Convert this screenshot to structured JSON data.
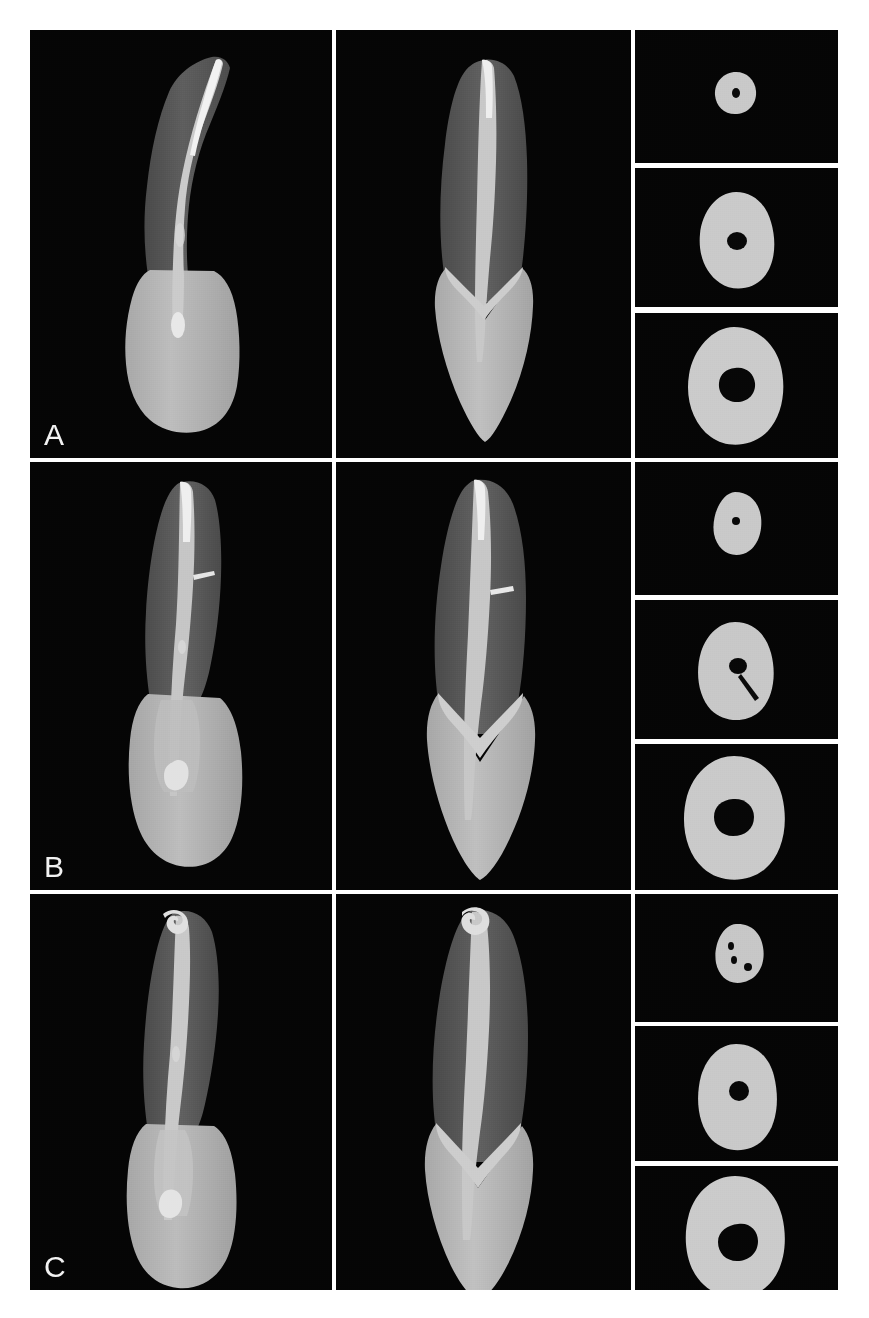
{
  "figure": {
    "background_color": "#ffffff",
    "panel_background_color": "#050505",
    "label_color": "#f2f2f2",
    "tissue_colors": {
      "enamel": "#b9b9b9",
      "dentin": "#5a5a5a",
      "canal_filling": "#cfcfcf",
      "canal_highlight": "#f0f0f0",
      "cross_section_dentin": "#c8c8c8",
      "canal_lumen": "#070707"
    },
    "rows": [
      {
        "label": "A",
        "specimen": "tooth-a",
        "views": [
          {
            "name": "buccolingual-view",
            "caption": ""
          },
          {
            "name": "proximal-view",
            "caption": ""
          },
          {
            "name": "axial-sections",
            "caption": ""
          }
        ],
        "cross_sections": [
          {
            "level": "apical",
            "canal_shape": "round",
            "canal_count": 1
          },
          {
            "level": "middle",
            "canal_shape": "oval",
            "canal_count": 1
          },
          {
            "level": "coronal",
            "canal_shape": "irregular-oval",
            "canal_count": 1
          }
        ]
      },
      {
        "label": "B",
        "specimen": "tooth-b",
        "views": [
          {
            "name": "buccolingual-view",
            "caption": ""
          },
          {
            "name": "proximal-view",
            "caption": ""
          },
          {
            "name": "axial-sections",
            "caption": ""
          }
        ],
        "cross_sections": [
          {
            "level": "apical",
            "canal_shape": "round",
            "canal_count": 1
          },
          {
            "level": "middle",
            "canal_shape": "oval-with-fin",
            "canal_count": 1
          },
          {
            "level": "coronal",
            "canal_shape": "rounded-square",
            "canal_count": 1
          }
        ]
      },
      {
        "label": "C",
        "specimen": "tooth-c",
        "views": [
          {
            "name": "buccolingual-view",
            "caption": ""
          },
          {
            "name": "proximal-view",
            "caption": ""
          },
          {
            "name": "axial-sections",
            "caption": ""
          }
        ],
        "cross_sections": [
          {
            "level": "apical",
            "canal_shape": "multiple-accessory",
            "canal_count": 3
          },
          {
            "level": "middle",
            "canal_shape": "round",
            "canal_count": 1
          },
          {
            "level": "coronal",
            "canal_shape": "irregular",
            "canal_count": 1
          }
        ]
      }
    ]
  }
}
